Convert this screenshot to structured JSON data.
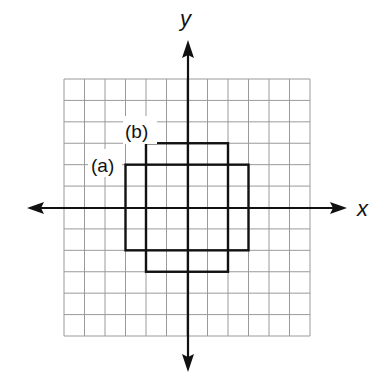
{
  "figure": {
    "grid": {
      "x_min": -6,
      "x_max": 6,
      "y_min": -6,
      "y_max": 6,
      "step": 1,
      "line_color": "#9a9a9a"
    },
    "axes": {
      "x_label": "x",
      "y_label": "y",
      "color": "#111111"
    },
    "rectangles": [
      {
        "label": "(a)",
        "x_min": -3,
        "x_max": 3,
        "y_min": -2,
        "y_max": 2
      },
      {
        "label": "(b)",
        "x_min": -2,
        "x_max": 2,
        "y_min": -3,
        "y_max": 3
      }
    ]
  },
  "chart_data": {
    "type": "diagram",
    "title": "",
    "xlabel": "x",
    "ylabel": "y",
    "xlim": [
      -6,
      6
    ],
    "ylim": [
      -6,
      6
    ],
    "grid": true,
    "shapes": [
      {
        "name": "(a)",
        "type": "rectangle",
        "vertices": [
          [
            -3,
            2
          ],
          [
            3,
            2
          ],
          [
            3,
            -2
          ],
          [
            -3,
            -2
          ]
        ],
        "width": 6,
        "height": 4
      },
      {
        "name": "(b)",
        "type": "rectangle",
        "vertices": [
          [
            -2,
            3
          ],
          [
            2,
            3
          ],
          [
            2,
            -3
          ],
          [
            -2,
            -3
          ]
        ],
        "width": 4,
        "height": 6
      }
    ]
  }
}
